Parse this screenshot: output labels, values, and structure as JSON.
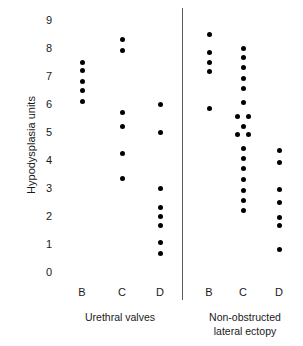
{
  "chart_data": {
    "type": "scatter",
    "title": "",
    "xlabel": "",
    "ylabel": "Hypodysplasia units",
    "ylim": [
      0,
      9
    ],
    "yticks": [
      0,
      1,
      2,
      3,
      4,
      5,
      6,
      7,
      8,
      9
    ],
    "grid": false,
    "legend": "none",
    "panels": [
      {
        "name": "Urethral valves",
        "categories": [
          "B",
          "C",
          "D"
        ],
        "groups": [
          {
            "category": "B",
            "values": [
              7.5,
              7.2,
              6.8,
              6.5,
              6.1
            ]
          },
          {
            "category": "C",
            "values": [
              8.3,
              7.9,
              5.7,
              5.2,
              4.25,
              3.35
            ]
          },
          {
            "category": "D",
            "values": [
              6.0,
              5.0,
              3.0,
              2.3,
              2.0,
              1.65,
              1.05,
              0.65
            ]
          }
        ]
      },
      {
        "name": "Non-obstructed lateral ectopy",
        "categories": [
          "B",
          "C",
          "D"
        ],
        "groups": [
          {
            "category": "B",
            "values": [
              8.5,
              7.85,
              7.5,
              7.15,
              5.85
            ]
          },
          {
            "category": "C",
            "values": [
              8.0,
              7.65,
              7.3,
              6.9,
              6.55,
              6.05,
              5.55,
              5.55,
              5.2,
              4.9,
              4.9,
              4.4,
              4.05,
              3.7,
              3.3,
              2.9,
              2.55,
              2.2
            ]
          },
          {
            "category": "D",
            "values": [
              4.35,
              3.9,
              2.95,
              2.5,
              1.95,
              1.65,
              0.8
            ]
          }
        ]
      }
    ],
    "axis_labels": {
      "left_panel_caption": "Urethral valves",
      "right_panel_caption_line1": "Non-obstructed",
      "right_panel_caption_line2": "lateral ectopy"
    }
  }
}
